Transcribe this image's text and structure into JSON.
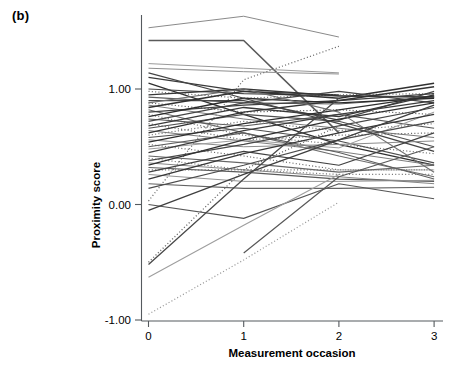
{
  "figure": {
    "panel_label": "(b)",
    "background": "#ffffff"
  },
  "chart_data": {
    "type": "line",
    "title": "",
    "subtitle": "",
    "xlabel": "Measurement occasion",
    "ylabel": "Proximity score",
    "x": [
      0,
      1,
      2,
      3
    ],
    "xticks": [
      0,
      1,
      2,
      3
    ],
    "xtick_labels": [
      "0",
      "1",
      "2",
      "3"
    ],
    "yticks": [
      -1.0,
      0.0,
      1.0
    ],
    "ytick_labels": [
      "-1.00",
      "0.00",
      "1.00"
    ],
    "xlim": [
      -0.08,
      3.12
    ],
    "ylim": [
      -1.0,
      1.72
    ],
    "grid": false,
    "legend": "none",
    "series": [
      {
        "name": "s01",
        "style": "solid",
        "color": "#8a8a8a",
        "width": 1.0,
        "x": [
          0,
          1,
          2
        ],
        "values": [
          1.53,
          1.63,
          1.45
        ]
      },
      {
        "name": "s02",
        "style": "solid",
        "color": "#5a5a5a",
        "width": 1.6,
        "x": [
          0,
          1,
          2
        ],
        "values": [
          1.42,
          1.42,
          0.62
        ]
      },
      {
        "name": "s03",
        "style": "solid",
        "color": "#9a9a9a",
        "width": 1.0,
        "x": [
          0,
          1,
          2
        ],
        "values": [
          1.22,
          1.18,
          1.14
        ]
      },
      {
        "name": "s04",
        "style": "solid",
        "color": "#8f8f8f",
        "width": 1.0,
        "x": [
          0,
          1,
          2
        ],
        "values": [
          1.18,
          1.15,
          1.13
        ]
      },
      {
        "name": "s05",
        "style": "dotted",
        "color": "#6a6a6a",
        "width": 1.2,
        "x": [
          0,
          1,
          2
        ],
        "values": [
          0.03,
          1.08,
          1.37
        ]
      },
      {
        "name": "s06",
        "style": "solid",
        "color": "#3a3a3a",
        "width": 1.3,
        "x": [
          0,
          1,
          2
        ],
        "values": [
          1.1,
          0.98,
          0.95
        ]
      },
      {
        "name": "s07",
        "style": "solid",
        "color": "#2f2f2f",
        "width": 1.3,
        "x": [
          0,
          1,
          2,
          3
        ],
        "values": [
          1.05,
          0.78,
          0.52,
          0.34
        ]
      },
      {
        "name": "s08",
        "style": "solid",
        "color": "#4a4a4a",
        "width": 1.2,
        "x": [
          0,
          1,
          2,
          3
        ],
        "values": [
          1.0,
          0.96,
          0.94,
          0.93
        ]
      },
      {
        "name": "s09",
        "style": "dotted",
        "color": "#707070",
        "width": 1.2,
        "x": [
          0,
          1,
          2,
          3
        ],
        "values": [
          0.98,
          0.92,
          0.95,
          0.96
        ]
      },
      {
        "name": "s10",
        "style": "solid",
        "color": "#353535",
        "width": 1.3,
        "x": [
          0,
          1,
          2,
          3
        ],
        "values": [
          0.95,
          1.0,
          0.94,
          0.93
        ]
      },
      {
        "name": "s11",
        "style": "solid",
        "color": "#5f5f5f",
        "width": 1.1,
        "x": [
          0,
          1,
          2,
          3
        ],
        "values": [
          0.93,
          0.88,
          0.87,
          0.93
        ]
      },
      {
        "name": "s12",
        "style": "solid",
        "color": "#484848",
        "width": 1.2,
        "x": [
          0,
          1,
          2,
          3
        ],
        "values": [
          0.9,
          0.9,
          0.73,
          0.98
        ]
      },
      {
        "name": "s13",
        "style": "dotted",
        "color": "#606060",
        "width": 1.2,
        "x": [
          0,
          1,
          2,
          3
        ],
        "values": [
          0.88,
          0.8,
          0.82,
          0.78
        ]
      },
      {
        "name": "s14",
        "style": "solid",
        "color": "#7a7a7a",
        "width": 1.0,
        "x": [
          0,
          1,
          2,
          3
        ],
        "values": [
          0.86,
          0.74,
          0.66,
          0.58
        ]
      },
      {
        "name": "s15",
        "style": "solid",
        "color": "#303030",
        "width": 1.4,
        "x": [
          0,
          1,
          2,
          3
        ],
        "values": [
          0.84,
          0.98,
          0.92,
          1.05
        ]
      },
      {
        "name": "s16",
        "style": "solid",
        "color": "#6d6d6d",
        "width": 1.1,
        "x": [
          0,
          1,
          2,
          3
        ],
        "values": [
          0.82,
          0.62,
          0.42,
          0.24
        ]
      },
      {
        "name": "s17",
        "style": "solid",
        "color": "#404040",
        "width": 1.2,
        "x": [
          0,
          1,
          2,
          3
        ],
        "values": [
          0.8,
          0.86,
          0.9,
          0.96
        ]
      },
      {
        "name": "s18",
        "style": "dotted",
        "color": "#787878",
        "width": 1.2,
        "x": [
          0,
          1,
          2,
          3
        ],
        "values": [
          0.78,
          0.6,
          0.52,
          0.44
        ]
      },
      {
        "name": "s19",
        "style": "solid",
        "color": "#2a2a2a",
        "width": 1.3,
        "x": [
          0,
          1,
          2,
          3
        ],
        "values": [
          0.76,
          0.92,
          0.88,
          0.92
        ]
      },
      {
        "name": "s20",
        "style": "solid",
        "color": "#565656",
        "width": 1.1,
        "x": [
          0,
          1,
          2,
          3
        ],
        "values": [
          0.74,
          0.68,
          0.78,
          0.66
        ]
      },
      {
        "name": "s21",
        "style": "solid",
        "color": "#454545",
        "width": 1.2,
        "x": [
          0,
          1,
          2,
          3
        ],
        "values": [
          0.72,
          0.88,
          0.98,
          0.88
        ]
      },
      {
        "name": "s22",
        "style": "dotted",
        "color": "#6b6b6b",
        "width": 1.2,
        "x": [
          0,
          1,
          2,
          3
        ],
        "values": [
          0.7,
          0.56,
          0.6,
          0.62
        ]
      },
      {
        "name": "s23",
        "style": "solid",
        "color": "#383838",
        "width": 1.3,
        "x": [
          0,
          1,
          2,
          3
        ],
        "values": [
          0.68,
          0.84,
          0.76,
          0.95
        ]
      },
      {
        "name": "s24",
        "style": "solid",
        "color": "#505050",
        "width": 1.1,
        "x": [
          0,
          1,
          2,
          3
        ],
        "values": [
          0.66,
          0.78,
          0.72,
          0.5
        ]
      },
      {
        "name": "s25",
        "style": "solid",
        "color": "#7e7e7e",
        "width": 1.0,
        "x": [
          0,
          1,
          2,
          3
        ],
        "values": [
          0.64,
          0.55,
          0.46,
          0.34
        ]
      },
      {
        "name": "s26",
        "style": "solid",
        "color": "#333333",
        "width": 1.4,
        "x": [
          0,
          1,
          2,
          3
        ],
        "values": [
          0.62,
          0.8,
          0.9,
          1.02
        ]
      },
      {
        "name": "s27",
        "style": "dotted",
        "color": "#757575",
        "width": 1.2,
        "x": [
          0,
          1,
          2,
          3
        ],
        "values": [
          0.6,
          0.72,
          0.64,
          0.7
        ]
      },
      {
        "name": "s28",
        "style": "solid",
        "color": "#4e4e4e",
        "width": 1.2,
        "x": [
          0,
          1,
          2,
          3
        ],
        "values": [
          0.58,
          0.66,
          0.55,
          0.36
        ]
      },
      {
        "name": "s29",
        "style": "solid",
        "color": "#8c8c8c",
        "width": 1.0,
        "x": [
          0,
          1,
          2,
          3
        ],
        "values": [
          0.56,
          0.5,
          0.52,
          0.55
        ]
      },
      {
        "name": "s30",
        "style": "solid",
        "color": "#2e2e2e",
        "width": 1.3,
        "x": [
          0,
          1,
          2,
          3
        ],
        "values": [
          0.54,
          0.7,
          0.82,
          0.94
        ]
      },
      {
        "name": "s31",
        "style": "dotted",
        "color": "#6e6e6e",
        "width": 1.2,
        "x": [
          0,
          1,
          2,
          3
        ],
        "values": [
          0.52,
          0.42,
          0.3,
          0.3
        ]
      },
      {
        "name": "s32",
        "style": "solid",
        "color": "#5c5c5c",
        "width": 1.1,
        "x": [
          0,
          1,
          2,
          3
        ],
        "values": [
          0.5,
          0.62,
          0.45,
          0.22
        ]
      },
      {
        "name": "s33",
        "style": "solid",
        "color": "#9c9c9c",
        "width": 1.0,
        "x": [
          0,
          1,
          2,
          3
        ],
        "values": [
          0.48,
          0.56,
          0.49,
          0.8
        ]
      },
      {
        "name": "s34",
        "style": "solid",
        "color": "#3c3c3c",
        "width": 1.3,
        "x": [
          0,
          1,
          2,
          3
        ],
        "values": [
          0.45,
          0.64,
          0.78,
          0.9
        ]
      },
      {
        "name": "s35",
        "style": "solid",
        "color": "#666666",
        "width": 1.1,
        "x": [
          0,
          1,
          2,
          3
        ],
        "values": [
          0.42,
          0.36,
          0.28,
          0.34
        ]
      },
      {
        "name": "s36",
        "style": "dotted",
        "color": "#7c7c7c",
        "width": 1.2,
        "x": [
          0,
          1,
          2,
          3
        ],
        "values": [
          0.4,
          0.3,
          0.26,
          0.26
        ]
      },
      {
        "name": "s37",
        "style": "solid",
        "color": "#474747",
        "width": 1.2,
        "x": [
          0,
          1,
          2,
          3
        ],
        "values": [
          0.38,
          0.52,
          0.68,
          0.84
        ]
      },
      {
        "name": "s38",
        "style": "solid",
        "color": "#868686",
        "width": 1.0,
        "x": [
          0,
          1,
          2,
          3
        ],
        "values": [
          0.36,
          0.3,
          0.24,
          0.18
        ]
      },
      {
        "name": "s39",
        "style": "solid",
        "color": "#313131",
        "width": 1.3,
        "x": [
          0,
          1,
          2,
          3
        ],
        "values": [
          0.34,
          0.56,
          0.74,
          0.88
        ]
      },
      {
        "name": "s40",
        "style": "solid",
        "color": "#5a5a5a",
        "width": 1.1,
        "x": [
          0,
          1,
          2,
          3
        ],
        "values": [
          0.32,
          0.28,
          0.22,
          0.2
        ]
      },
      {
        "name": "s41",
        "style": "dotted",
        "color": "#727272",
        "width": 1.2,
        "x": [
          0,
          1,
          2,
          3
        ],
        "values": [
          0.3,
          0.3,
          0.3,
          0.3
        ]
      },
      {
        "name": "s42",
        "style": "solid",
        "color": "#414141",
        "width": 1.2,
        "x": [
          0,
          1,
          2,
          3
        ],
        "values": [
          0.28,
          0.46,
          0.34,
          0.62
        ]
      },
      {
        "name": "s43",
        "style": "solid",
        "color": "#949494",
        "width": 1.0,
        "x": [
          0,
          1,
          2,
          3
        ],
        "values": [
          0.26,
          0.2,
          0.2,
          0.21
        ]
      },
      {
        "name": "s44",
        "style": "solid",
        "color": "#383838",
        "width": 1.3,
        "x": [
          0,
          1,
          2,
          3
        ],
        "values": [
          0.22,
          0.44,
          0.62,
          0.78
        ]
      },
      {
        "name": "s45",
        "style": "solid",
        "color": "#636363",
        "width": 1.1,
        "x": [
          0,
          1,
          2,
          3
        ],
        "values": [
          0.18,
          0.14,
          0.14,
          0.15
        ]
      },
      {
        "name": "s46",
        "style": "solid",
        "color": "#4c4c4c",
        "width": 1.2,
        "x": [
          0,
          1,
          2,
          3
        ],
        "values": [
          0.14,
          0.34,
          0.56,
          0.72
        ]
      },
      {
        "name": "s47",
        "style": "solid",
        "color": "#555555",
        "width": 1.1,
        "x": [
          0,
          1,
          2,
          3
        ],
        "values": [
          0.0,
          -0.12,
          0.18,
          0.05
        ]
      },
      {
        "name": "s48",
        "style": "solid",
        "color": "#3f3f3f",
        "width": 1.3,
        "x": [
          0,
          1,
          2,
          3
        ],
        "values": [
          -0.05,
          0.26,
          0.56,
          0.86
        ]
      },
      {
        "name": "s49",
        "style": "dotted",
        "color": "#6a6a6a",
        "width": 1.3,
        "x": [
          0,
          1,
          2
        ],
        "values": [
          -0.5,
          0.3,
          0.68
        ]
      },
      {
        "name": "s50",
        "style": "solid",
        "color": "#4a4a4a",
        "width": 1.3,
        "x": [
          0,
          1,
          2
        ],
        "values": [
          -0.52,
          0.22,
          0.92
        ]
      },
      {
        "name": "s51",
        "style": "solid",
        "color": "#9e9e9e",
        "width": 1.1,
        "x": [
          0,
          1,
          2
        ],
        "values": [
          -0.63,
          -0.18,
          0.26
        ]
      },
      {
        "name": "s52",
        "style": "solid",
        "color": "#585858",
        "width": 1.2,
        "x": [
          1,
          2,
          3
        ],
        "values": [
          -0.42,
          0.24,
          0.5
        ]
      },
      {
        "name": "s53",
        "style": "dotted",
        "color": "#9a9a9a",
        "width": 1.2,
        "x": [
          0,
          1,
          2
        ],
        "values": [
          -0.95,
          -0.48,
          0.02
        ]
      },
      {
        "name": "s54",
        "style": "solid",
        "color": "#6f6f6f",
        "width": 1.1,
        "x": [
          0,
          1,
          2,
          3
        ],
        "values": [
          0.88,
          1.0,
          0.8,
          0.28
        ]
      },
      {
        "name": "s55",
        "style": "solid",
        "color": "#444444",
        "width": 1.2,
        "x": [
          0,
          1,
          2,
          3
        ],
        "values": [
          1.14,
          0.92,
          0.7,
          0.46
        ]
      }
    ]
  }
}
